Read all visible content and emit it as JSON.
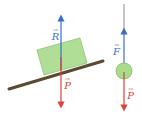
{
  "diagram": {
    "left": {
      "description": "block on inclined plane",
      "vectors": [
        {
          "name": "R",
          "label": "R",
          "color": "#3d6fc4",
          "direction": "up"
        },
        {
          "name": "P",
          "label": "P",
          "color": "#e0403a",
          "direction": "down"
        }
      ],
      "block_color": "#a8db8c",
      "plane_color": "#5a4a30"
    },
    "right": {
      "description": "ball hanging from string",
      "vectors": [
        {
          "name": "F",
          "label": "F",
          "color": "#3d6fc4",
          "direction": "up"
        },
        {
          "name": "P",
          "label": "P",
          "color": "#e0403a",
          "direction": "down"
        }
      ],
      "ball_color": "#a8db8c",
      "string_color": "#8a8a8a"
    },
    "vector_arrow_glyph": "→"
  }
}
